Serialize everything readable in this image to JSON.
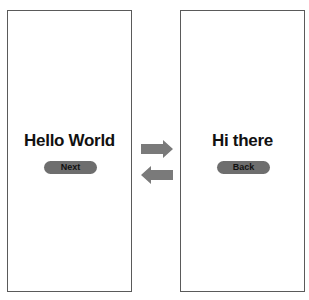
{
  "screens": [
    {
      "id": "screen-1",
      "title": "Hello World",
      "button_label": "Next"
    },
    {
      "id": "screen-2",
      "title": "Hi there",
      "button_label": "Back"
    }
  ],
  "transitions": [
    {
      "direction": "forward",
      "icon": "arrow-right-icon",
      "from": "Hello World",
      "to": "Hi there"
    },
    {
      "direction": "backward",
      "icon": "arrow-left-icon",
      "from": "Hi there",
      "to": "Hello World"
    }
  ],
  "colors": {
    "frame_border": "#5a5a5a",
    "button_fill": "#6e6e6e",
    "arrow_fill": "#7a7a7a",
    "text": "#111111"
  }
}
